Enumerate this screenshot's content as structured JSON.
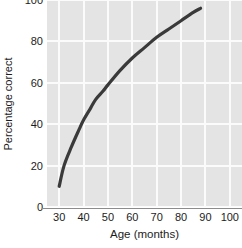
{
  "chart_data": {
    "type": "line",
    "title": "",
    "xlabel": "Age (months)",
    "ylabel": "Percentage correct",
    "xlim": [
      25,
      105
    ],
    "ylim": [
      0,
      100
    ],
    "xticks": [
      30,
      40,
      50,
      60,
      70,
      80,
      90,
      100
    ],
    "yticks": [
      0,
      20,
      40,
      60,
      80,
      100
    ],
    "xtick_labels": [
      "30",
      "40",
      "50",
      "60",
      "70",
      "80",
      "90",
      "100"
    ],
    "ytick_labels": [
      "0",
      "20",
      "40",
      "60",
      "80",
      "100"
    ],
    "grid": true,
    "legend": "none",
    "series": [
      {
        "name": "Percentage correct by age",
        "color": "#3a3a3a",
        "line_width": 3.2,
        "x": [
          30,
          32,
          35,
          38,
          40,
          43,
          45,
          48,
          50,
          55,
          60,
          65,
          70,
          75,
          80,
          85,
          88
        ],
        "values": [
          10,
          20,
          29,
          37,
          42,
          48,
          52,
          56,
          59,
          66,
          72,
          77,
          82,
          86,
          90,
          94,
          96
        ]
      }
    ],
    "plot_background": "#e4e4e4",
    "grid_color": "#fbfbfb",
    "axis_color": "#8c8c8c",
    "figure_background": "#ffffff"
  }
}
